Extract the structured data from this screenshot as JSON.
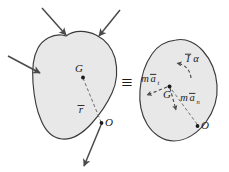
{
  "figure": {
    "type": "mechanics-free-body-equivalence-diagram",
    "background_color": "#ffffff",
    "body_fill_color": "#e8e8e8",
    "body_stroke_color": "#3a3a3a",
    "arrow_color": "#4a4a4a",
    "text_color": "#1a1a1a",
    "equivalence_symbol": "≡"
  },
  "left_body": {
    "name": "rigid-body-with-applied-forces",
    "points": [
      {
        "id": "G",
        "label": "G",
        "role": "center-of-mass",
        "x": 83,
        "y": 76
      },
      {
        "id": "O",
        "label": "O",
        "role": "reference-point",
        "x": 103,
        "y": 124
      }
    ],
    "vector_label": "r",
    "vector_label_overbar": true,
    "vector_description": "position vector from G to O",
    "applied_force_arrows": [
      {
        "id": "force-top-left",
        "direction": "down-right",
        "from": [
          42,
          8
        ],
        "to": [
          66,
          36
        ]
      },
      {
        "id": "force-top-right",
        "direction": "down-left",
        "from": [
          119,
          10
        ],
        "to": [
          98,
          37
        ]
      },
      {
        "id": "force-left",
        "direction": "right-down",
        "from": [
          8,
          56
        ],
        "to": [
          42,
          73
        ]
      },
      {
        "id": "force-bottom",
        "direction": "down-left",
        "from": [
          101,
          125
        ],
        "to": [
          85,
          166
        ]
      }
    ]
  },
  "right_body": {
    "name": "rigid-body-with-equivalent-kinetic-vectors",
    "points": [
      {
        "id": "G",
        "label": "G",
        "role": "center-of-mass",
        "x": 169,
        "y": 88
      },
      {
        "id": "O",
        "label": "O",
        "role": "reference-point",
        "x": 200,
        "y": 128
      }
    ],
    "kinetic_vectors": [
      {
        "id": "I-alpha",
        "label_base": "I",
        "label_overbar": true,
        "label_suffix": "α",
        "display": "Īα",
        "description": "moment couple I-bar alpha",
        "arrow_style": "curved-dashed",
        "label_x": 191,
        "label_y": 56
      },
      {
        "id": "m-a-t",
        "label_prefix": "m",
        "label_base": "a",
        "label_overbar": true,
        "label_subscript": "t",
        "display": "māₜ",
        "description": "tangential inertia force m a-bar t",
        "arrow_style": "straight-dashed",
        "label_x": 144,
        "label_y": 76
      },
      {
        "id": "m-a-n",
        "label_prefix": "m",
        "label_base": "a",
        "label_overbar": true,
        "label_subscript": "n",
        "display": "māₙ",
        "description": "normal inertia force m a-bar n",
        "arrow_style": "straight-dashed",
        "label_x": 186,
        "label_y": 95
      }
    ],
    "connector_line": {
      "id": "G-to-O-dashed",
      "description": "dashed line from G to O"
    }
  },
  "labels": {
    "G": "G",
    "O": "O",
    "r_bar": "r",
    "I_alpha_I": "I",
    "I_alpha_alpha": "α",
    "m_prefix": "m",
    "a_base": "a",
    "sub_t": "t",
    "sub_n": "n",
    "equiv": "≡",
    "overbar": "‾"
  }
}
